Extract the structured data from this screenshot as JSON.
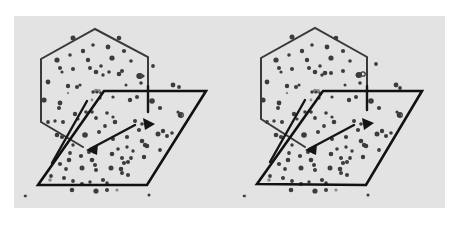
{
  "figure": {
    "type": "stereo-pair",
    "background": "#e3e3e3",
    "border_color": "#ffffff",
    "ink_color": "#1a1a1a",
    "panel": {
      "x": 14,
      "y": 16,
      "width": 431,
      "height": 192
    },
    "views": [
      {
        "name": "left-view",
        "offset_x": 0,
        "hexagon": [
          [
            95,
            29
          ],
          [
            148,
            57
          ],
          [
            148,
            112
          ],
          [
            148,
            112
          ]
        ],
        "hexagon_path": "M148,112 L148,57 L95,29 L41,59 L41,122 L83,147",
        "parallelogram_path": "M104,91 L206,91 L147,185 L38,185 Z",
        "guide_lines": [
          "M148,86 L148,112",
          "M87,101 L52,163",
          "M90,149 L135,125"
        ],
        "arrowheads": [
          {
            "name": "arrowhead-right",
            "points": "143,118 155,124 145,130"
          },
          {
            "name": "arrowhead-left",
            "points": "98,144 86,150 97,155"
          }
        ]
      },
      {
        "name": "right-view",
        "offset_x": 219,
        "hexagon_path": "M367,110 L367,57 L315,28 L261,58 L261,119 L305,147",
        "parallelogram_path": "M323,91 L422,91 L366,185 L257,184 Z",
        "guide_lines": [
          "M367,86 L367,110",
          "M305,100 L270,162",
          "M309,149 L354,125"
        ],
        "arrowheads": [
          {
            "name": "arrowhead-right",
            "points": "362,118 374,123 364,130"
          },
          {
            "name": "arrowhead-left",
            "points": "317,144 305,150 316,155"
          }
        ]
      }
    ],
    "dots": [
      [
        73,
        38,
        2.5
      ],
      [
        83,
        51,
        2.2
      ],
      [
        93,
        45,
        1.8
      ],
      [
        108,
        47,
        2.4
      ],
      [
        112,
        58,
        2.6
      ],
      [
        119,
        38,
        2.3
      ],
      [
        124,
        51,
        2.1
      ],
      [
        57,
        60,
        2.6
      ],
      [
        60,
        68,
        2.0
      ],
      [
        70,
        55,
        1.8
      ],
      [
        62,
        72,
        1.6
      ],
      [
        73,
        69,
        2.0
      ],
      [
        88,
        60,
        2.2
      ],
      [
        90,
        68,
        2.0
      ],
      [
        96,
        72,
        2.3
      ],
      [
        101,
        66,
        1.8
      ],
      [
        103,
        75,
        1.7
      ],
      [
        109,
        72,
        1.8
      ],
      [
        119,
        74,
        2.3
      ],
      [
        122,
        71,
        2.0
      ],
      [
        131,
        61,
        1.8
      ],
      [
        139,
        76,
        2.7
      ],
      [
        143,
        76,
        1.6
      ],
      [
        153,
        66,
        1.9
      ],
      [
        126,
        85,
        1.5
      ],
      [
        141,
        83,
        1.8
      ],
      [
        48,
        82,
        2.4
      ],
      [
        68,
        86,
        2.2
      ],
      [
        77,
        87,
        2.0
      ],
      [
        80,
        85,
        1.6
      ],
      [
        93,
        92,
        1.7
      ],
      [
        97,
        92,
        1.6
      ],
      [
        101,
        93,
        1.6
      ],
      [
        44,
        100,
        2.6
      ],
      [
        60,
        103,
        2.4
      ],
      [
        59,
        108,
        2.0
      ],
      [
        75,
        114,
        2.2
      ],
      [
        86,
        112,
        1.8
      ],
      [
        100,
        98,
        1.6
      ],
      [
        113,
        97,
        1.6
      ],
      [
        130,
        100,
        2.2
      ],
      [
        137,
        97,
        2.0
      ],
      [
        152,
        101,
        2.8
      ],
      [
        160,
        108,
        2.1
      ],
      [
        173,
        85,
        2.4
      ],
      [
        179,
        87,
        1.9
      ],
      [
        48,
        122,
        1.9
      ],
      [
        55,
        121,
        1.7
      ],
      [
        63,
        122,
        2.0
      ],
      [
        78,
        119,
        1.6
      ],
      [
        92,
        112,
        1.8
      ],
      [
        96,
        118,
        1.9
      ],
      [
        107,
        113,
        1.8
      ],
      [
        113,
        117,
        1.6
      ],
      [
        115,
        122,
        2.3
      ],
      [
        105,
        126,
        1.9
      ],
      [
        135,
        121,
        2.0
      ],
      [
        142,
        124,
        1.8
      ],
      [
        180,
        115,
        2.4
      ],
      [
        178,
        112,
        1.6
      ],
      [
        57,
        135,
        2.3
      ],
      [
        62,
        137,
        2.1
      ],
      [
        85,
        135,
        2.8
      ],
      [
        99,
        132,
        2.0
      ],
      [
        113,
        139,
        2.0
      ],
      [
        127,
        137,
        2.1
      ],
      [
        139,
        130,
        2.1
      ],
      [
        158,
        134,
        2.5
      ],
      [
        163,
        131,
        2.2
      ],
      [
        167,
        136,
        2.0
      ],
      [
        172,
        133,
        1.8
      ],
      [
        142,
        141,
        2.3
      ],
      [
        145,
        145,
        2.2
      ],
      [
        160,
        150,
        1.9
      ],
      [
        73,
        145,
        1.7
      ],
      [
        70,
        153,
        1.9
      ],
      [
        81,
        156,
        2.1
      ],
      [
        89,
        152,
        2.0
      ],
      [
        95,
        152,
        2.0
      ],
      [
        112,
        154,
        2.3
      ],
      [
        118,
        149,
        1.8
      ],
      [
        122,
        158,
        2.0
      ],
      [
        127,
        147,
        1.7
      ],
      [
        133,
        151,
        1.7
      ],
      [
        144,
        157,
        2.2
      ],
      [
        147,
        146,
        2.3
      ],
      [
        60,
        164,
        2.1
      ],
      [
        69,
        160,
        2.3
      ],
      [
        66,
        169,
        1.9
      ],
      [
        82,
        168,
        2.5
      ],
      [
        92,
        160,
        2.3
      ],
      [
        95,
        165,
        2.0
      ],
      [
        96,
        170,
        2.0
      ],
      [
        111,
        168,
        2.5
      ],
      [
        121,
        169,
        2.3
      ],
      [
        124,
        163,
        2.1
      ],
      [
        128,
        162,
        2.0
      ],
      [
        131,
        158,
        1.9
      ],
      [
        122,
        173,
        2.0
      ],
      [
        128,
        175,
        2.0
      ],
      [
        51,
        176,
        1.9
      ],
      [
        64,
        178,
        2.0
      ],
      [
        73,
        181,
        1.9
      ],
      [
        82,
        184,
        2.1
      ],
      [
        90,
        182,
        1.7
      ],
      [
        103,
        180,
        2.1
      ],
      [
        107,
        183,
        1.8
      ],
      [
        72,
        190,
        2.3
      ],
      [
        96,
        191,
        2.6
      ],
      [
        107,
        190,
        2.0
      ],
      [
        25,
        196,
        1.3
      ],
      [
        149,
        195,
        1.5
      ],
      [
        292,
        37,
        2.5
      ],
      [
        302,
        51,
        2.2
      ],
      [
        312,
        45,
        1.8
      ],
      [
        327,
        47,
        2.4
      ],
      [
        331,
        58,
        2.6
      ],
      [
        336,
        38,
        2.3
      ],
      [
        343,
        51,
        2.1
      ],
      [
        276,
        60,
        2.6
      ],
      [
        279,
        68,
        2.0
      ],
      [
        289,
        55,
        1.8
      ],
      [
        281,
        72,
        1.6
      ],
      [
        292,
        69,
        2.0
      ],
      [
        307,
        60,
        2.2
      ],
      [
        309,
        68,
        2.0
      ],
      [
        315,
        72,
        2.3
      ],
      [
        320,
        66,
        1.8
      ],
      [
        322,
        75,
        1.7
      ],
      [
        325,
        73,
        2.3
      ],
      [
        331,
        73,
        2.0
      ],
      [
        343,
        71,
        2.0
      ],
      [
        350,
        61,
        1.8
      ],
      [
        358,
        75,
        2.5
      ],
      [
        360,
        75,
        1.8
      ],
      [
        376,
        64,
        1.9
      ],
      [
        345,
        85,
        1.5
      ],
      [
        360,
        83,
        1.8
      ],
      [
        267,
        82,
        2.4
      ],
      [
        287,
        86,
        2.2
      ],
      [
        296,
        87,
        2.0
      ],
      [
        299,
        85,
        1.6
      ],
      [
        312,
        92,
        1.7
      ],
      [
        316,
        92,
        1.6
      ],
      [
        320,
        93,
        1.6
      ],
      [
        263,
        100,
        2.6
      ],
      [
        279,
        103,
        2.4
      ],
      [
        278,
        108,
        2.0
      ],
      [
        294,
        114,
        2.2
      ],
      [
        305,
        112,
        1.8
      ],
      [
        319,
        98,
        1.6
      ],
      [
        332,
        97,
        1.6
      ],
      [
        349,
        100,
        2.2
      ],
      [
        356,
        97,
        2.0
      ],
      [
        371,
        101,
        2.8
      ],
      [
        379,
        108,
        2.1
      ],
      [
        396,
        85,
        2.4
      ],
      [
        400,
        88,
        1.9
      ],
      [
        267,
        122,
        1.9
      ],
      [
        274,
        121,
        1.7
      ],
      [
        282,
        122,
        2.0
      ],
      [
        297,
        119,
        1.6
      ],
      [
        311,
        112,
        1.8
      ],
      [
        315,
        118,
        1.9
      ],
      [
        326,
        113,
        1.8
      ],
      [
        332,
        117,
        1.6
      ],
      [
        334,
        122,
        2.3
      ],
      [
        324,
        126,
        1.9
      ],
      [
        354,
        121,
        2.0
      ],
      [
        361,
        124,
        1.8
      ],
      [
        399,
        115,
        2.4
      ],
      [
        397,
        112,
        1.6
      ],
      [
        276,
        135,
        2.3
      ],
      [
        281,
        137,
        2.1
      ],
      [
        304,
        135,
        2.8
      ],
      [
        318,
        132,
        2.0
      ],
      [
        332,
        139,
        2.0
      ],
      [
        346,
        137,
        2.1
      ],
      [
        358,
        130,
        2.1
      ],
      [
        377,
        134,
        2.5
      ],
      [
        382,
        131,
        2.2
      ],
      [
        386,
        136,
        2.0
      ],
      [
        391,
        133,
        1.8
      ],
      [
        361,
        141,
        2.3
      ],
      [
        364,
        145,
        2.2
      ],
      [
        379,
        150,
        1.9
      ],
      [
        292,
        145,
        1.7
      ],
      [
        289,
        153,
        1.9
      ],
      [
        300,
        156,
        2.1
      ],
      [
        308,
        152,
        2.0
      ],
      [
        314,
        152,
        2.0
      ],
      [
        331,
        154,
        2.3
      ],
      [
        337,
        149,
        1.8
      ],
      [
        341,
        158,
        2.0
      ],
      [
        346,
        147,
        1.7
      ],
      [
        352,
        151,
        1.7
      ],
      [
        363,
        157,
        2.2
      ],
      [
        366,
        146,
        2.3
      ],
      [
        279,
        164,
        2.1
      ],
      [
        288,
        160,
        2.3
      ],
      [
        285,
        169,
        1.9
      ],
      [
        301,
        168,
        2.5
      ],
      [
        311,
        160,
        2.3
      ],
      [
        314,
        165,
        2.0
      ],
      [
        315,
        170,
        2.0
      ],
      [
        330,
        168,
        2.5
      ],
      [
        340,
        169,
        2.3
      ],
      [
        343,
        163,
        2.1
      ],
      [
        347,
        162,
        2.0
      ],
      [
        350,
        158,
        1.9
      ],
      [
        341,
        173,
        2.0
      ],
      [
        347,
        175,
        2.0
      ],
      [
        270,
        176,
        1.9
      ],
      [
        283,
        178,
        2.0
      ],
      [
        292,
        181,
        1.9
      ],
      [
        301,
        184,
        2.1
      ],
      [
        309,
        182,
        1.7
      ],
      [
        322,
        180,
        2.1
      ],
      [
        326,
        183,
        1.8
      ],
      [
        291,
        190,
        2.3
      ],
      [
        315,
        191,
        2.6
      ],
      [
        326,
        190,
        2.0
      ],
      [
        244,
        196,
        1.3
      ],
      [
        368,
        195,
        1.5
      ]
    ],
    "light_dots": [
      [
        96,
        91,
        2.2
      ],
      [
        99,
        91,
        2.0
      ],
      [
        92,
        100,
        1.4
      ],
      [
        68,
        93,
        1.2
      ],
      [
        50,
        180,
        1.8
      ],
      [
        117,
        190,
        1.6
      ],
      [
        26,
        196,
        1.4
      ],
      [
        315,
        91,
        2.2
      ],
      [
        318,
        91,
        2.0
      ],
      [
        311,
        100,
        1.4
      ],
      [
        287,
        93,
        1.2
      ],
      [
        269,
        180,
        1.8
      ],
      [
        336,
        190,
        1.6
      ],
      [
        245,
        196,
        1.4
      ]
    ],
    "ring_dots": [
      [
        140,
        76,
        2.4
      ],
      [
        181,
        115,
        2.3
      ],
      [
        359,
        75,
        2.4
      ],
      [
        400,
        115,
        2.3
      ],
      [
        363,
        74,
        2.2
      ]
    ]
  }
}
